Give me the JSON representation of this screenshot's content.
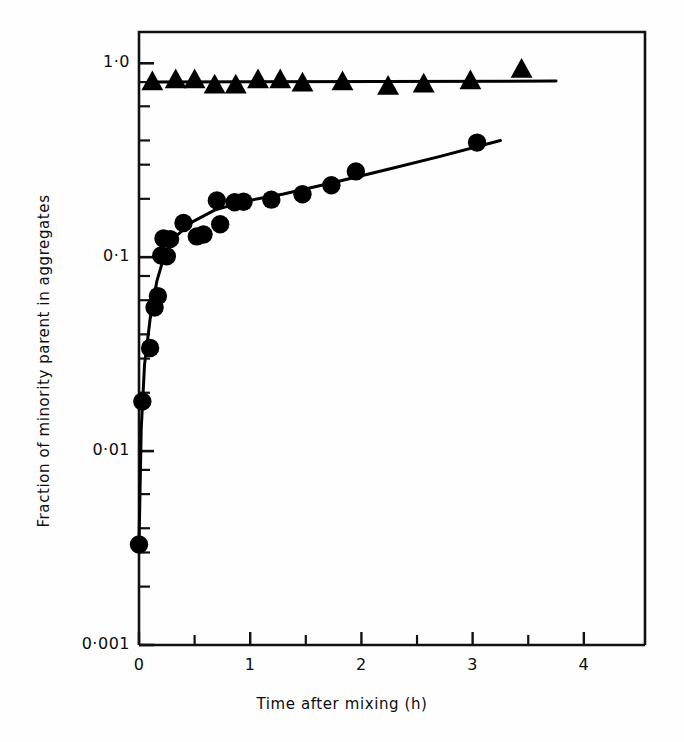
{
  "chart_data": {
    "type": "scatter",
    "title": "",
    "subtitle": "",
    "xlabel": "Time after mixing (h)",
    "ylabel": "Fraction of minority parent in aggregates",
    "xlim": [
      0,
      4.55
    ],
    "ylim": [
      0.001,
      1.45
    ],
    "yscale": "log",
    "xscale": "linear",
    "grid": false,
    "legend": "none",
    "x_ticks_major": [
      0,
      1,
      2,
      3,
      4
    ],
    "x_tick_labels": [
      "0",
      "1",
      "2",
      "3",
      "4"
    ],
    "x_ticks_minor": [
      0.5,
      1.5,
      2.5,
      3.5
    ],
    "y_ticks_major": [
      1.0,
      0.1,
      0.01,
      0.001
    ],
    "y_tick_labels": [
      "1·0",
      "0·1",
      "0·01",
      "0·001"
    ],
    "y_ticks_minor": [
      0.8,
      0.6,
      0.4,
      0.3,
      0.2,
      0.08,
      0.06,
      0.04,
      0.03,
      0.02,
      0.008,
      0.006,
      0.004,
      0.003,
      0.002
    ],
    "series": [
      {
        "name": "triangles",
        "marker": "triangle",
        "color": "#000000",
        "line": "solid",
        "points": [
          {
            "x": 0.12,
            "y": 0.8
          },
          {
            "x": 0.33,
            "y": 0.82
          },
          {
            "x": 0.5,
            "y": 0.82
          },
          {
            "x": 0.68,
            "y": 0.77
          },
          {
            "x": 0.87,
            "y": 0.77
          },
          {
            "x": 1.07,
            "y": 0.82
          },
          {
            "x": 1.27,
            "y": 0.82
          },
          {
            "x": 1.47,
            "y": 0.79
          },
          {
            "x": 1.83,
            "y": 0.8
          },
          {
            "x": 2.24,
            "y": 0.76
          },
          {
            "x": 2.56,
            "y": 0.78
          },
          {
            "x": 2.98,
            "y": 0.81
          },
          {
            "x": 3.44,
            "y": 0.93
          }
        ],
        "line_points": [
          {
            "x": 0.1,
            "y": 0.8
          },
          {
            "x": 3.75,
            "y": 0.81
          }
        ]
      },
      {
        "name": "circles",
        "marker": "circle",
        "color": "#000000",
        "line": "solid",
        "points": [
          {
            "x": 0.0,
            "y": 0.0033
          },
          {
            "x": 0.03,
            "y": 0.018
          },
          {
            "x": 0.1,
            "y": 0.034
          },
          {
            "x": 0.14,
            "y": 0.055
          },
          {
            "x": 0.17,
            "y": 0.063
          },
          {
            "x": 0.2,
            "y": 0.102
          },
          {
            "x": 0.25,
            "y": 0.101
          },
          {
            "x": 0.22,
            "y": 0.125
          },
          {
            "x": 0.28,
            "y": 0.124
          },
          {
            "x": 0.4,
            "y": 0.15
          },
          {
            "x": 0.52,
            "y": 0.128
          },
          {
            "x": 0.58,
            "y": 0.131
          },
          {
            "x": 0.7,
            "y": 0.196
          },
          {
            "x": 0.73,
            "y": 0.148
          },
          {
            "x": 0.86,
            "y": 0.192
          },
          {
            "x": 0.94,
            "y": 0.193
          },
          {
            "x": 1.19,
            "y": 0.198
          },
          {
            "x": 1.47,
            "y": 0.211
          },
          {
            "x": 1.73,
            "y": 0.235
          },
          {
            "x": 1.95,
            "y": 0.277
          },
          {
            "x": 3.04,
            "y": 0.39
          }
        ],
        "line_points": [
          {
            "x": 0.0,
            "y": 0.0033
          },
          {
            "x": 0.02,
            "y": 0.013
          },
          {
            "x": 0.05,
            "y": 0.028
          },
          {
            "x": 0.1,
            "y": 0.048
          },
          {
            "x": 0.16,
            "y": 0.075
          },
          {
            "x": 0.23,
            "y": 0.103
          },
          {
            "x": 0.33,
            "y": 0.128
          },
          {
            "x": 0.48,
            "y": 0.152
          },
          {
            "x": 0.68,
            "y": 0.175
          },
          {
            "x": 0.95,
            "y": 0.194
          },
          {
            "x": 1.3,
            "y": 0.212
          },
          {
            "x": 1.75,
            "y": 0.243
          },
          {
            "x": 2.25,
            "y": 0.285
          },
          {
            "x": 2.7,
            "y": 0.33
          },
          {
            "x": 3.25,
            "y": 0.4
          }
        ]
      }
    ]
  }
}
